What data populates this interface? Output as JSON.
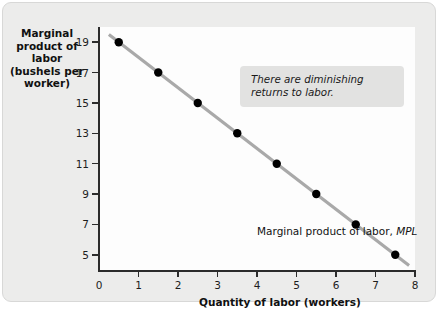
{
  "chart_data": {
    "type": "scatter",
    "title": "",
    "xlabel": "Quantity of labor (workers)",
    "ylabel": "Marginal product of labor (bushels per worker)",
    "ylabel_lines": [
      "Marginal",
      "product of labor",
      "(bushels per",
      "worker)"
    ],
    "xlim": [
      0,
      8
    ],
    "ylim": [
      4,
      20
    ],
    "xticks": [
      0,
      1,
      2,
      3,
      4,
      5,
      6,
      7,
      8
    ],
    "xtick_labels": [
      "0",
      "1",
      "2",
      "3",
      "4",
      "5",
      "6",
      "7",
      "8"
    ],
    "yticks": [
      5,
      7,
      9,
      11,
      13,
      15,
      17,
      19
    ],
    "ytick_labels": [
      "5",
      "7",
      "9",
      "11",
      "13",
      "15",
      "17",
      "19"
    ],
    "grid": false,
    "legend": false,
    "x": [
      0.5,
      1.5,
      2.5,
      3.5,
      4.5,
      5.5,
      6.5,
      7.5
    ],
    "values": [
      19,
      17,
      15,
      13,
      11,
      9,
      7,
      5
    ],
    "series": [
      {
        "name": "Marginal product of labor, MPL",
        "x": [
          0.5,
          1.5,
          2.5,
          3.5,
          4.5,
          5.5,
          6.5,
          7.5
        ],
        "values": [
          19,
          17,
          15,
          13,
          11,
          9,
          7,
          5
        ],
        "line_color": "#a9a9a9",
        "marker_color": "#000000"
      }
    ],
    "line_extent": {
      "x0": 0.25,
      "y0": 19.5,
      "x1": 7.85,
      "y1": 4.3
    },
    "annotations": [
      {
        "text": "There are diminishing returns to labor.",
        "style": "italic-box",
        "box_color": "#e2e2e1"
      },
      {
        "text": "Marginal product of labor, ",
        "emphasis": "MPL",
        "style": "curve-label"
      }
    ]
  },
  "figure": {
    "background": "#ececeb",
    "plot_background": "#fdfdfd",
    "axis_color": "#2b2b2b"
  },
  "annotation_box": {
    "line1": "There are diminishing",
    "line2": "returns to labor."
  },
  "curve_label": {
    "prefix": "Marginal product of labor, ",
    "emphasis": "MPL"
  }
}
